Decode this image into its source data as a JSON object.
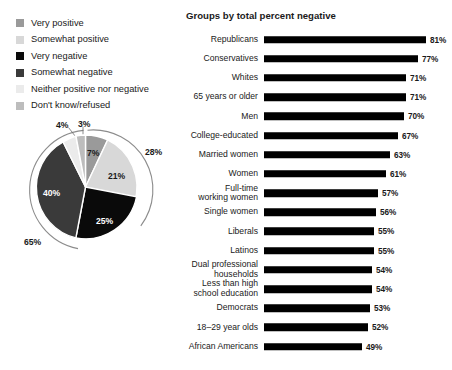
{
  "clipped_header": "",
  "legend": {
    "items": [
      {
        "label": "Very positive",
        "color": "#9a9a9a",
        "icon": "legend-swatch"
      },
      {
        "label": "Somewhat positive",
        "color": "#d8d8d8",
        "icon": "legend-swatch"
      },
      {
        "label": "Very negative",
        "color": "#0a0a0a",
        "icon": "legend-swatch"
      },
      {
        "label": "Somewhat negative",
        "color": "#3a3a3a",
        "icon": "legend-swatch"
      },
      {
        "label": "Neither positive nor negative",
        "color": "#ebebeb",
        "icon": "legend-swatch"
      },
      {
        "label": "Don't know/refused",
        "color": "#bdbdbd",
        "icon": "legend-swatch"
      }
    ]
  },
  "chart_data": [
    {
      "type": "pie",
      "title": "",
      "categories": [
        "Very positive",
        "Somewhat positive",
        "Very negative",
        "Somewhat negative",
        "Neither positive nor negative",
        "Don't know/refused"
      ],
      "values": [
        7,
        21,
        25,
        40,
        4,
        3
      ],
      "labels": [
        "7%",
        "21%",
        "25%",
        "40%",
        "4%",
        "3%"
      ],
      "colors": [
        "#9a9a9a",
        "#d8d8d8",
        "#0a0a0a",
        "#3a3a3a",
        "#ebebeb",
        "#bdbdbd"
      ],
      "annotations": [
        {
          "text": "28%",
          "meaning": "total positive",
          "position": "outer-right"
        },
        {
          "text": "65%",
          "meaning": "total negative",
          "position": "outer-left"
        }
      ],
      "legend": "top-left"
    },
    {
      "type": "bar",
      "orientation": "horizontal",
      "title": "Groups by total percent negative",
      "xlabel": "",
      "ylabel": "",
      "xlim": [
        0,
        81
      ],
      "grid": false,
      "categories": [
        "Republicans",
        "Conservatives",
        "Whites",
        "65 years or older",
        "Men",
        "College-educated",
        "Married women",
        "Women",
        "Full-time working women",
        "Single women",
        "Liberals",
        "Latinos",
        "Dual professional households",
        "Less than high school education",
        "Democrats",
        "18–29 year olds",
        "African Americans"
      ],
      "values": [
        81,
        77,
        71,
        71,
        70,
        67,
        63,
        61,
        57,
        56,
        55,
        55,
        54,
        54,
        53,
        52,
        49
      ],
      "value_labels": [
        "81%",
        "77%",
        "71%",
        "71%",
        "70%",
        "67%",
        "63%",
        "61%",
        "57%",
        "56%",
        "55%",
        "55%",
        "54%",
        "54%",
        "53%",
        "52%",
        "49%"
      ],
      "bar_color": "#000000"
    }
  ],
  "bars_rows": [
    {
      "line1": "Republicans",
      "line2": "",
      "value": 81,
      "value_label": "81%"
    },
    {
      "line1": "Conservatives",
      "line2": "",
      "value": 77,
      "value_label": "77%"
    },
    {
      "line1": "Whites",
      "line2": "",
      "value": 71,
      "value_label": "71%"
    },
    {
      "line1": "65 years or older",
      "line2": "",
      "value": 71,
      "value_label": "71%"
    },
    {
      "line1": "Men",
      "line2": "",
      "value": 70,
      "value_label": "70%"
    },
    {
      "line1": "College-educated",
      "line2": "",
      "value": 67,
      "value_label": "67%"
    },
    {
      "line1": "Married women",
      "line2": "",
      "value": 63,
      "value_label": "63%"
    },
    {
      "line1": "Women",
      "line2": "",
      "value": 61,
      "value_label": "61%"
    },
    {
      "line1": "Full-time",
      "line2": "working women",
      "value": 57,
      "value_label": "57%"
    },
    {
      "line1": "Single women",
      "line2": "",
      "value": 56,
      "value_label": "56%"
    },
    {
      "line1": "Liberals",
      "line2": "",
      "value": 55,
      "value_label": "55%"
    },
    {
      "line1": "Latinos",
      "line2": "",
      "value": 55,
      "value_label": "55%"
    },
    {
      "line1": "Dual professional",
      "line2": "households",
      "value": 54,
      "value_label": "54%"
    },
    {
      "line1": "Less than high",
      "line2": "school education",
      "value": 54,
      "value_label": "54%"
    },
    {
      "line1": "Democrats",
      "line2": "",
      "value": 53,
      "value_label": "53%"
    },
    {
      "line1": "18–29 year olds",
      "line2": "",
      "value": 52,
      "value_label": "52%"
    },
    {
      "line1": "African Americans",
      "line2": "",
      "value": 49,
      "value_label": "49%"
    }
  ],
  "bars_title": "Groups by total percent negative",
  "pie_labels": {
    "very_positive": "7%",
    "somewhat_positive": "21%",
    "very_negative": "25%",
    "somewhat_negative": "40%",
    "neither": "4%",
    "dont_know": "3%",
    "total_positive": "28%",
    "total_negative": "65%"
  }
}
